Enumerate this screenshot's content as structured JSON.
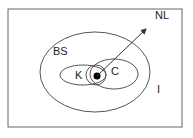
{
  "diagram": {
    "labels": {
      "nl": "NL",
      "bs": "BS",
      "k": "K",
      "c": "C",
      "i": "I"
    },
    "colors": {
      "stroke": "#555555",
      "text": "#222222",
      "dot": "#000000",
      "background": "#ffffff"
    }
  }
}
